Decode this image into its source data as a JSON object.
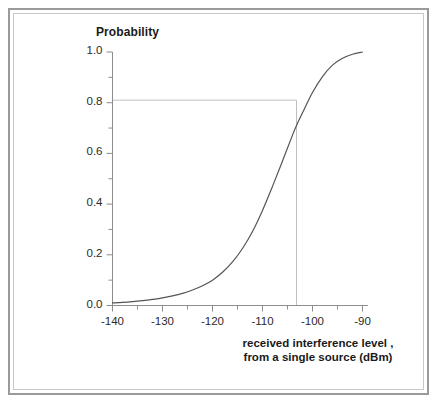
{
  "figure": {
    "frame_color": "#9a9a9a",
    "background": "#ffffff"
  },
  "chart_data": {
    "type": "line",
    "title": "",
    "subtitle": "",
    "xlabel": "received interference level , from a single source (dBm)",
    "xlabel_line1": "received interference level ,",
    "xlabel_line2": "from a single source (dBm)",
    "ylabel": "Probability",
    "xlim": [
      -140,
      -90
    ],
    "ylim": [
      0.0,
      1.0
    ],
    "grid": false,
    "legend": null,
    "legend_position": "none",
    "x_major_ticks": [
      -140,
      -130,
      -120,
      -110,
      -100,
      -90
    ],
    "x_major_tick_labels": [
      "-140",
      "-130",
      "-120",
      "-110",
      "-100",
      "-90"
    ],
    "x_minor_tick_step": 5,
    "y_major_ticks": [
      0.0,
      0.2,
      0.4,
      0.6,
      0.8,
      1.0
    ],
    "y_major_tick_labels": [
      "0.0",
      "0.2",
      "0.4",
      "0.6",
      "0.8",
      "1.0"
    ],
    "y_minor_tick_step": 0.1,
    "line_color": "#555555",
    "line_width": 1.2,
    "series": [
      {
        "name": "cumulative probability",
        "x": [
          -140,
          -138,
          -136,
          -134,
          -132,
          -130,
          -128,
          -126,
          -124,
          -122,
          -120,
          -118,
          -116,
          -114,
          -112,
          -110,
          -108,
          -106,
          -104,
          -103.2,
          -102,
          -100,
          -98,
          -96,
          -94,
          -92,
          -90
        ],
        "values": [
          0.01,
          0.012,
          0.015,
          0.019,
          0.024,
          0.03,
          0.038,
          0.048,
          0.061,
          0.078,
          0.1,
          0.131,
          0.172,
          0.225,
          0.292,
          0.375,
          0.47,
          0.57,
          0.672,
          0.71,
          0.76,
          0.84,
          0.903,
          0.948,
          0.975,
          0.991,
          1.0
        ]
      }
    ],
    "annotations": [
      {
        "name": "reference-lines",
        "type": "crosshair",
        "x": -103.2,
        "y": 0.81,
        "color": "#bfbfbf",
        "description": "horizontal line at probability 0.81 meeting vertical line at -103.2 dBm"
      }
    ]
  }
}
